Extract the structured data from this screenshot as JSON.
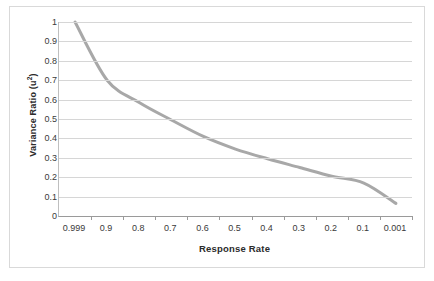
{
  "chart_data": {
    "type": "line",
    "title": "",
    "xlabel": "Response Rate",
    "ylabel": "Variance Ratio (u²)",
    "ylabel_base": "Variance Ratio (u",
    "ylabel_sup": "2",
    "ylabel_tail": ")",
    "categories": [
      "0.999",
      "0.9",
      "0.8",
      "0.7",
      "0.6",
      "0.5",
      "0.4",
      "0.3",
      "0.2",
      "0.1",
      "0.001"
    ],
    "series": [
      {
        "name": "Variance Ratio",
        "values": [
          1.0,
          0.7,
          0.585,
          0.495,
          0.41,
          0.345,
          0.295,
          0.25,
          0.205,
          0.17,
          0.065
        ],
        "color": "#a8a8a8",
        "line_width": 3
      }
    ],
    "ylim": [
      0,
      1
    ],
    "ytick_labels": [
      "1",
      "0.9",
      "0.8",
      "0.7",
      "0.6",
      "0.5",
      "0.4",
      "0.3",
      "0.2",
      "0.1",
      "0"
    ],
    "ytick_values": [
      1,
      0.9,
      0.8,
      0.7,
      0.6,
      0.5,
      0.4,
      0.3,
      0.2,
      0.1,
      0
    ],
    "grid": "horizontal",
    "legend": "none",
    "gridline_color": "#d6d6d6",
    "axis_color": "#9a9a9a",
    "plot_background": "#ffffff",
    "border_color": "#d9d9d9"
  }
}
